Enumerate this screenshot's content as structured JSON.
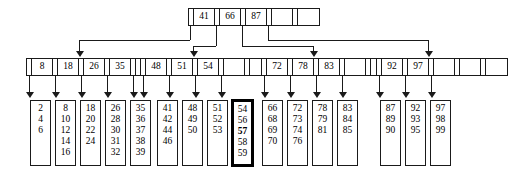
{
  "diagram": {
    "type": "b-plus-tree",
    "levels": 3,
    "highlight_note": "57"
  },
  "root": {
    "name": "root-node",
    "x": 188,
    "y": 8,
    "keys": [
      "41",
      "66",
      "87"
    ],
    "empty_slots": 1,
    "pointers": 4
  },
  "internal": [
    {
      "name": "internal-node-1",
      "x": 26,
      "y": 58,
      "keys": [
        "8",
        "18",
        "26",
        "35"
      ],
      "empty_slots": 0,
      "pointers": 5
    },
    {
      "name": "internal-node-2",
      "x": 140,
      "y": 58,
      "keys": [
        "48",
        "51",
        "54"
      ],
      "empty_slots": 1,
      "pointers": 4
    },
    {
      "name": "internal-node-3",
      "x": 261,
      "y": 58,
      "keys": [
        "72",
        "78",
        "83"
      ],
      "empty_slots": 1,
      "pointers": 4
    },
    {
      "name": "internal-node-4",
      "x": 376,
      "y": 58,
      "keys": [
        "92",
        "97"
      ],
      "empty_slots": 2,
      "pointers": 3
    }
  ],
  "leaves": [
    {
      "name": "leaf-node-1",
      "x": 30,
      "y": 100,
      "values": [
        "2",
        "4",
        "6"
      ],
      "highlight": false,
      "bold_value": null
    },
    {
      "name": "leaf-node-2",
      "x": 55,
      "y": 100,
      "values": [
        "8",
        "10",
        "12",
        "14",
        "16"
      ],
      "highlight": false,
      "bold_value": null
    },
    {
      "name": "leaf-node-3",
      "x": 80,
      "y": 100,
      "values": [
        "18",
        "20",
        "22",
        "24"
      ],
      "highlight": false,
      "bold_value": null
    },
    {
      "name": "leaf-node-4",
      "x": 105,
      "y": 100,
      "values": [
        "26",
        "28",
        "30",
        "31",
        "32"
      ],
      "highlight": false,
      "bold_value": null
    },
    {
      "name": "leaf-node-5",
      "x": 130,
      "y": 100,
      "values": [
        "35",
        "36",
        "37",
        "38",
        "39"
      ],
      "highlight": false,
      "bold_value": null
    },
    {
      "name": "leaf-node-6",
      "x": 157,
      "y": 100,
      "values": [
        "41",
        "42",
        "44",
        "46"
      ],
      "highlight": false,
      "bold_value": null
    },
    {
      "name": "leaf-node-7",
      "x": 182,
      "y": 100,
      "values": [
        "48",
        "49",
        "50"
      ],
      "highlight": false,
      "bold_value": null
    },
    {
      "name": "leaf-node-8",
      "x": 207,
      "y": 100,
      "values": [
        "51",
        "52",
        "53"
      ],
      "highlight": false,
      "bold_value": null
    },
    {
      "name": "leaf-node-9",
      "x": 232,
      "y": 100,
      "values": [
        "54",
        "56",
        "57",
        "58",
        "59"
      ],
      "highlight": true,
      "bold_value": "57"
    },
    {
      "name": "leaf-node-10",
      "x": 262,
      "y": 100,
      "values": [
        "66",
        "68",
        "69",
        "70"
      ],
      "highlight": false,
      "bold_value": null
    },
    {
      "name": "leaf-node-11",
      "x": 287,
      "y": 100,
      "values": [
        "72",
        "73",
        "74",
        "76"
      ],
      "highlight": false,
      "bold_value": null
    },
    {
      "name": "leaf-node-12",
      "x": 312,
      "y": 100,
      "values": [
        "78",
        "79",
        "81"
      ],
      "highlight": false,
      "bold_value": null
    },
    {
      "name": "leaf-node-13",
      "x": 337,
      "y": 100,
      "values": [
        "83",
        "84",
        "85"
      ],
      "highlight": false,
      "bold_value": null
    },
    {
      "name": "leaf-node-14",
      "x": 380,
      "y": 100,
      "values": [
        "87",
        "89",
        "90"
      ],
      "highlight": false,
      "bold_value": null
    },
    {
      "name": "leaf-node-15",
      "x": 405,
      "y": 100,
      "values": [
        "92",
        "93",
        "95"
      ],
      "highlight": false,
      "bold_value": null
    },
    {
      "name": "leaf-node-16",
      "x": 430,
      "y": 100,
      "values": [
        "97",
        "98",
        "99"
      ],
      "highlight": false,
      "bold_value": null
    }
  ],
  "edges": {
    "root_to_internal": [
      {
        "name": "edge-root-to-internal-1",
        "from_x": 190,
        "to_x": 79,
        "bus_y": 40
      },
      {
        "name": "edge-root-to-internal-2",
        "from_x": 216,
        "to_x": 193,
        "bus_y": 46
      },
      {
        "name": "edge-root-to-internal-3",
        "from_x": 242,
        "to_x": 313,
        "bus_y": 46
      },
      {
        "name": "edge-root-to-internal-4",
        "from_x": 268,
        "to_x": 428,
        "bus_y": 40
      }
    ],
    "internal_to_leaf": [
      {
        "name": "edge-internal-1-to-leaf-1",
        "x": 29,
        "leaf_x": 40
      },
      {
        "name": "edge-internal-1-to-leaf-2",
        "x": 55,
        "leaf_x": 65
      },
      {
        "name": "edge-internal-1-to-leaf-3",
        "x": 81,
        "leaf_x": 90
      },
      {
        "name": "edge-internal-1-to-leaf-4",
        "x": 107,
        "leaf_x": 115
      },
      {
        "name": "edge-internal-1-to-leaf-5",
        "x": 133,
        "leaf_x": 140
      },
      {
        "name": "edge-internal-2-to-leaf-6",
        "x": 143,
        "leaf_x": 167
      },
      {
        "name": "edge-internal-2-to-leaf-7",
        "x": 169,
        "leaf_x": 192
      },
      {
        "name": "edge-internal-2-to-leaf-8",
        "x": 195,
        "leaf_x": 217
      },
      {
        "name": "edge-internal-2-to-leaf-9",
        "x": 221,
        "leaf_x": 242
      },
      {
        "name": "edge-internal-3-to-leaf-10",
        "x": 264,
        "leaf_x": 272
      },
      {
        "name": "edge-internal-3-to-leaf-11",
        "x": 290,
        "leaf_x": 297
      },
      {
        "name": "edge-internal-3-to-leaf-12",
        "x": 316,
        "leaf_x": 322
      },
      {
        "name": "edge-internal-3-to-leaf-13",
        "x": 342,
        "leaf_x": 347
      },
      {
        "name": "edge-internal-4-to-leaf-14",
        "x": 379,
        "leaf_x": 390
      },
      {
        "name": "edge-internal-4-to-leaf-15",
        "x": 405,
        "leaf_x": 415
      },
      {
        "name": "edge-internal-4-to-leaf-16",
        "x": 431,
        "leaf_x": 440
      }
    ]
  }
}
